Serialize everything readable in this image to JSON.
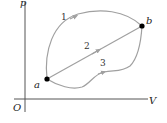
{
  "diagram": {
    "type": "pV-diagram",
    "axes": {
      "y_label": "p",
      "x_label": "V",
      "origin_label": "O",
      "color": "#555555"
    },
    "points": [
      {
        "id": "a",
        "label": "a",
        "x": 47,
        "y": 79
      },
      {
        "id": "b",
        "label": "b",
        "x": 142,
        "y": 26
      }
    ],
    "paths": [
      {
        "id": "1",
        "label": "1",
        "from": "a",
        "to": "b",
        "shape": "upper curve"
      },
      {
        "id": "2",
        "label": "2",
        "from": "a",
        "to": "b",
        "shape": "straight line"
      },
      {
        "id": "3",
        "label": "3",
        "from": "a",
        "to": "b",
        "shape": "lower wavy curve"
      }
    ],
    "colors": {
      "path": "#a0a0a0",
      "point": "#000000",
      "axis": "#555555"
    }
  }
}
